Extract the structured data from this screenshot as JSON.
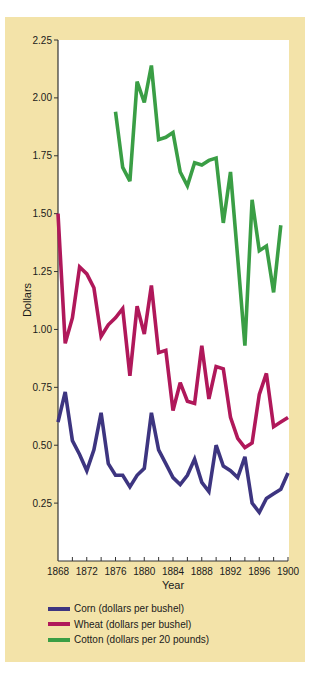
{
  "chart_data": {
    "type": "line",
    "title": "",
    "xlabel": "Year",
    "ylabel": "Dollars",
    "xlim": [
      1868,
      1900
    ],
    "ylim": [
      0,
      2.25
    ],
    "x_ticks": [
      "1868",
      "1872",
      "1876",
      "1880",
      "1884",
      "1888",
      "1892",
      "1896",
      "1900"
    ],
    "y_ticks": [
      "0.25",
      "0.50",
      "0.75",
      "1.00",
      "1.25",
      "1.50",
      "1.75",
      "2.00",
      "2.25"
    ],
    "grid": false,
    "legend_position": "bottom",
    "series": [
      {
        "name": "Corn (dollars per bushel)",
        "color": "#3d3580",
        "x": [
          1868,
          1869,
          1870,
          1871,
          1872,
          1873,
          1874,
          1875,
          1876,
          1877,
          1878,
          1879,
          1880,
          1881,
          1882,
          1883,
          1884,
          1885,
          1886,
          1887,
          1888,
          1889,
          1890,
          1891,
          1892,
          1893,
          1894,
          1895,
          1896,
          1897,
          1898,
          1899,
          1900
        ],
        "values": [
          0.6,
          0.73,
          0.52,
          0.46,
          0.39,
          0.48,
          0.64,
          0.42,
          0.37,
          0.37,
          0.32,
          0.37,
          0.4,
          0.64,
          0.48,
          0.42,
          0.36,
          0.33,
          0.37,
          0.44,
          0.34,
          0.3,
          0.5,
          0.41,
          0.39,
          0.36,
          0.45,
          0.25,
          0.21,
          0.27,
          0.29,
          0.31,
          0.38
        ]
      },
      {
        "name": "Wheat (dollars per bushel)",
        "color": "#b0185a",
        "x": [
          1868,
          1869,
          1870,
          1871,
          1872,
          1873,
          1874,
          1875,
          1876,
          1877,
          1878,
          1879,
          1880,
          1881,
          1882,
          1883,
          1884,
          1885,
          1886,
          1887,
          1888,
          1889,
          1890,
          1891,
          1892,
          1893,
          1894,
          1895,
          1896,
          1897,
          1898,
          1899,
          1900
        ],
        "values": [
          1.5,
          0.94,
          1.05,
          1.27,
          1.24,
          1.18,
          0.97,
          1.02,
          1.05,
          1.09,
          0.8,
          1.1,
          0.98,
          1.19,
          0.9,
          0.91,
          0.65,
          0.77,
          0.69,
          0.68,
          0.93,
          0.7,
          0.84,
          0.83,
          0.62,
          0.53,
          0.49,
          0.51,
          0.72,
          0.81,
          0.58,
          0.6,
          0.62
        ]
      },
      {
        "name": "Cotton (dollars per 20 pounds)",
        "color": "#3a9e45",
        "x": [
          1876,
          1877,
          1878,
          1879,
          1880,
          1881,
          1882,
          1883,
          1884,
          1885,
          1886,
          1887,
          1888,
          1889,
          1890,
          1891,
          1892,
          1893,
          1894,
          1895,
          1896,
          1897,
          1898,
          1899
        ],
        "values": [
          1.94,
          1.7,
          1.64,
          2.07,
          1.98,
          2.14,
          1.82,
          1.83,
          1.85,
          1.68,
          1.62,
          1.72,
          1.71,
          1.73,
          1.74,
          1.46,
          1.68,
          1.31,
          0.93,
          1.56,
          1.34,
          1.36,
          1.16,
          1.45
        ]
      }
    ]
  },
  "axes": {
    "ylabel": "Dollars",
    "xlabel": "Year"
  },
  "legend": {
    "items": [
      {
        "label": "Corn (dollars per bushel)",
        "color": "#3d3580"
      },
      {
        "label": "Wheat (dollars per bushel)",
        "color": "#b0185a"
      },
      {
        "label": "Cotton (dollars per 20 pounds)",
        "color": "#3a9e45"
      }
    ]
  },
  "colors": {
    "panel_background": "#f3e3a9",
    "plot_background": "#ffffff",
    "axis": "#333333"
  }
}
